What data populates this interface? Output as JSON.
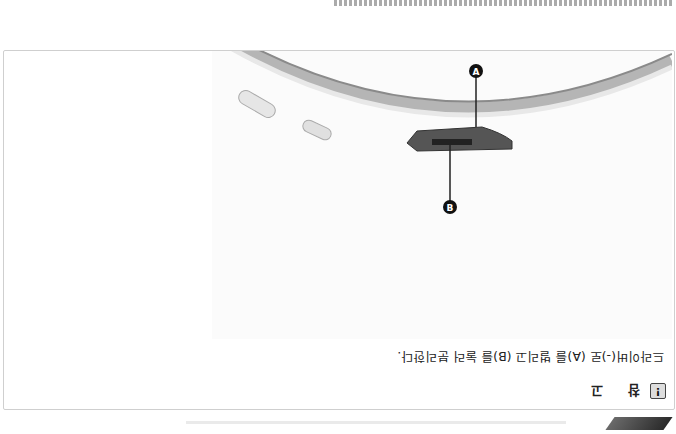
{
  "note": {
    "icon": "exclamation-icon",
    "title": "참 고",
    "text": "드라이버(-)로 (A)를 벌리고 (B)를 눌러 분리한다."
  },
  "figure": {
    "callouts": [
      {
        "label": "A",
        "description": "dark clip tab"
      },
      {
        "label": "B",
        "description": "release latch"
      }
    ]
  },
  "colors": {
    "border": "#cfcfcf",
    "text": "#222222",
    "callout_fill": "#111111",
    "trim": "#bdbdbd"
  }
}
